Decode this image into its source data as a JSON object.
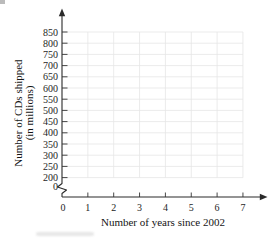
{
  "chart_data": {
    "type": "line",
    "series": [],
    "title": "",
    "xlabel": "Number of years since 2002",
    "ylabel": "Number of CDs shipped (in millions)",
    "ylabel_lines": [
      "Number of CDs shipped",
      "(in millions)"
    ],
    "x_ticks": [
      0,
      1,
      2,
      3,
      4,
      5,
      6,
      7
    ],
    "y_ticks": [
      200,
      250,
      300,
      350,
      400,
      450,
      500,
      550,
      600,
      650,
      700,
      750,
      800,
      850
    ],
    "y_origin_label": "0",
    "xlim": [
      0,
      7
    ],
    "ylim_display": [
      200,
      850
    ],
    "y_axis_break": true,
    "grid": true,
    "legend": "none",
    "colors": {
      "axis": "#2a2a2a",
      "grid": "#e6e6e6",
      "text": "#1e1e1e",
      "background": "#ffffff"
    }
  }
}
